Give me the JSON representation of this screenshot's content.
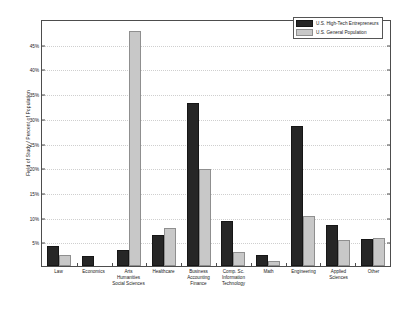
{
  "chart_data": {
    "type": "bar",
    "title": "",
    "xlabel": "",
    "ylabel": "Field of Study / Percent of Population",
    "ylim": [
      0,
      50
    ],
    "grid": true,
    "legend_position": "top-right",
    "ytick_labels": [
      "5%",
      "10%",
      "15%",
      "20%",
      "25%",
      "30%",
      "35%",
      "40%",
      "45%"
    ],
    "ytick_values": [
      5,
      10,
      15,
      20,
      25,
      30,
      35,
      40,
      45
    ],
    "categories": [
      "Law",
      "Economics",
      "Arts Humanities Social Sciences",
      "Healthcare",
      "Business Accounting Finance",
      "Comp. Sc. Information Technology",
      "Math",
      "Engineering",
      "Applied Sciences",
      "Other"
    ],
    "category_lines": [
      [
        "Law"
      ],
      [
        "Economics"
      ],
      [
        "Arts",
        "Humanities",
        "Social Sciences"
      ],
      [
        "Healthcare"
      ],
      [
        "Business",
        "Accounting",
        "Finance"
      ],
      [
        "Comp. Sc.",
        "Information",
        "Technology"
      ],
      [
        "Math"
      ],
      [
        "Engineering"
      ],
      [
        "Applied",
        "Sciences"
      ],
      [
        "Other"
      ]
    ],
    "series": [
      {
        "name": "U.S. High-Tech Entrepreneurs",
        "color": "#262626",
        "values": [
          4.0,
          2.0,
          3.2,
          6.2,
          33.0,
          9.2,
          2.2,
          28.3,
          8.3,
          5.4
        ]
      },
      {
        "name": "U.S. General Population",
        "color": "#c8c8c8",
        "values": [
          2.3,
          0.0,
          47.5,
          7.6,
          19.7,
          2.9,
          1.0,
          10.2,
          5.3,
          5.6
        ]
      }
    ]
  },
  "legend": {
    "items": [
      {
        "label": "U.S. High-Tech Entrepreneurs"
      },
      {
        "label": "U.S. General Population"
      }
    ]
  }
}
